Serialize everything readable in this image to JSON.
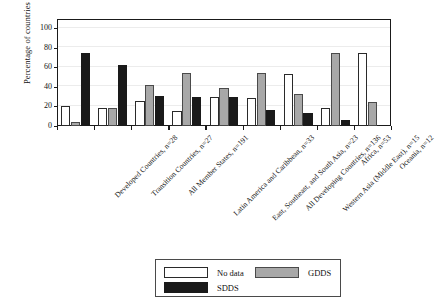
{
  "chart_data": {
    "type": "bar",
    "title": "",
    "subtitle": "",
    "xlabel": "",
    "ylabel": "Percentage of countries",
    "ylim": [
      0,
      110
    ],
    "yticks": [
      0,
      20,
      40,
      60,
      80,
      100
    ],
    "grid": true,
    "legend_position": "bottom-center",
    "categories": [
      "Developed Countries, n=28",
      "Transition Countries, n=27",
      "All Member States, n=191",
      "Latin America and Caribbean, n=33",
      "East, Southeast, and South Asia, n=23",
      "All Developing Countries, n=136",
      "Western Asia (Middle East), n=15",
      "Africa, n=53",
      "Oceania, n=12"
    ],
    "series": [
      {
        "name": "No data",
        "color": "#ffffff",
        "values": [
          21,
          19,
          26,
          15,
          30,
          29,
          53,
          19,
          75
        ]
      },
      {
        "name": "GDDS",
        "color": "#a8a8a8",
        "values": [
          4,
          19,
          42,
          55,
          39,
          55,
          33,
          75,
          25
        ]
      },
      {
        "name": "SDDS",
        "color": "#1a1a1a",
        "values": [
          75,
          63,
          31,
          30,
          30,
          16,
          13,
          6,
          0
        ]
      }
    ]
  },
  "axis": {
    "y_title": "Percentage of countries",
    "y_tick_labels": [
      "0",
      "20",
      "40",
      "60",
      "80",
      "100"
    ]
  },
  "legend": {
    "items": [
      {
        "label": "No data",
        "swatch": "nodata"
      },
      {
        "label": "GDDS",
        "swatch": "gdds"
      },
      {
        "label": "SDDS",
        "swatch": "sdds"
      }
    ]
  }
}
